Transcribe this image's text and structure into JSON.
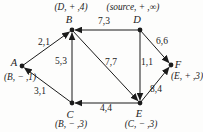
{
  "figure": {
    "background": "#fdfdfc",
    "line_color": "#1b1b1b",
    "text_color": "#1b1b1b",
    "node_radius": 2.4,
    "arrow_gap": 3.2,
    "nodes": [
      {
        "id": "A",
        "x": 22,
        "y": 66,
        "letter": "A",
        "letter_x": 14,
        "letter_y": 62,
        "tag": "(B, − ,1)",
        "tag_x": 20,
        "tag_y": 77
      },
      {
        "id": "B",
        "x": 72,
        "y": 30,
        "letter": "B",
        "letter_x": 69,
        "letter_y": 19,
        "tag": "(D, + ,4)",
        "tag_x": 71,
        "tag_y": 7
      },
      {
        "id": "C",
        "x": 72,
        "y": 103,
        "letter": "C",
        "letter_x": 70,
        "letter_y": 114,
        "tag": "(B, − ,3)",
        "tag_x": 71,
        "tag_y": 124
      },
      {
        "id": "D",
        "x": 140,
        "y": 30,
        "letter": "D",
        "letter_x": 137,
        "letter_y": 19,
        "tag": "(source, + ,∞)",
        "tag_x": 133,
        "tag_y": 7
      },
      {
        "id": "E",
        "x": 140,
        "y": 103,
        "letter": "E",
        "letter_x": 139,
        "letter_y": 113,
        "tag": "(C, − ,3)",
        "tag_x": 141,
        "tag_y": 124
      },
      {
        "id": "F",
        "x": 171,
        "y": 65,
        "letter": "F",
        "letter_x": 178,
        "letter_y": 64,
        "tag": "(E, + ,3)",
        "tag_x": 187,
        "tag_y": 76
      }
    ],
    "edges": [
      {
        "from": "A",
        "to": "B",
        "label": "2,1",
        "label_x": 44,
        "label_y": 42
      },
      {
        "from": "D",
        "to": "B",
        "label": "7,3",
        "label_x": 104,
        "label_y": 21
      },
      {
        "from": "D",
        "to": "F",
        "label": "6,6",
        "label_x": 162,
        "label_y": 41
      },
      {
        "from": "C",
        "to": "B",
        "label": "5,3",
        "label_x": 61,
        "label_y": 61
      },
      {
        "from": "B",
        "to": "E",
        "label": "7,7",
        "label_x": 111,
        "label_y": 62
      },
      {
        "from": "D",
        "to": "E",
        "label": "1,1",
        "label_x": 147,
        "label_y": 62
      },
      {
        "from": "C",
        "to": "A",
        "label": "3,1",
        "label_x": 40,
        "label_y": 91
      },
      {
        "from": "E",
        "to": "C",
        "label": "4,4",
        "label_x": 106,
        "label_y": 108
      },
      {
        "from": "E",
        "to": "F",
        "label": "8,4",
        "label_x": 156,
        "label_y": 89
      }
    ]
  }
}
